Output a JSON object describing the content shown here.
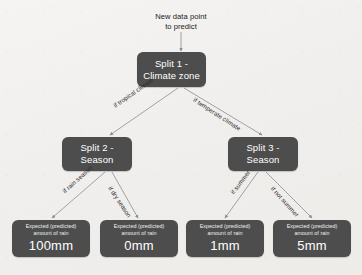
{
  "diagram": {
    "title_label": {
      "line1": "New data point",
      "line2": "to predict"
    },
    "colors": {
      "node_fill": "#4d4d4d",
      "node_text": "#ffffff",
      "connector": "#8d8d8d",
      "background": "#f2f1ef"
    },
    "splits": [
      {
        "id": "split-1",
        "line1": "Split 1 -",
        "line2": "Climate zone"
      },
      {
        "id": "split-2",
        "line1": "Split 2 -",
        "line2": "Season"
      },
      {
        "id": "split-3",
        "line1": "Split 3 -",
        "line2": "Season"
      }
    ],
    "edges": [
      {
        "id": "edge-tropical",
        "label": "if tropical climate"
      },
      {
        "id": "edge-temperate",
        "label": "if temperate climate"
      },
      {
        "id": "edge-rain-season",
        "label": "if rain season"
      },
      {
        "id": "edge-dry-season",
        "label": "if dry season"
      },
      {
        "id": "edge-summer",
        "label": "if summer"
      },
      {
        "id": "edge-not-summer",
        "label": "if not summer"
      }
    ],
    "leaves": [
      {
        "id": "leaf-100mm",
        "caption_line1": "Expected (predicted)",
        "caption_line2": "amount of rain",
        "value": "100mm"
      },
      {
        "id": "leaf-0mm",
        "caption_line1": "Expected (predicted)",
        "caption_line2": "amount of rain",
        "value": "0mm"
      },
      {
        "id": "leaf-1mm",
        "caption_line1": "Expected (predicted)",
        "caption_line2": "amount of rain",
        "value": "1mm"
      },
      {
        "id": "leaf-5mm",
        "caption_line1": "Expected (predicted)",
        "caption_line2": "amount of rain",
        "value": "5mm"
      }
    ]
  }
}
